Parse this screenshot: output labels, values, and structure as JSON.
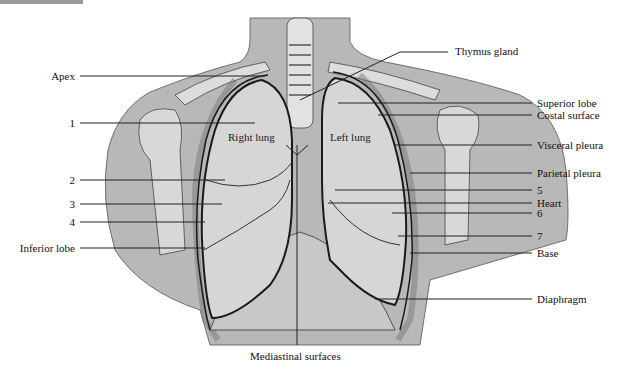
{
  "figure": {
    "colors": {
      "background": "#ffffff",
      "body_silhouette": "#b8b8b8",
      "lung_fill": "#d6d6d6",
      "bone_fill": "#dcdcdc",
      "outline": "#1a1a1a",
      "leader_line": "#222222",
      "corner_tab": "#9a9a9a"
    },
    "inner_labels": {
      "right_lung": "Right lung",
      "left_lung": "Left lung"
    },
    "left_labels": [
      {
        "id": "apex",
        "text": "Apex"
      },
      {
        "id": "n1",
        "text": "1"
      },
      {
        "id": "n2",
        "text": "2"
      },
      {
        "id": "n3",
        "text": "3"
      },
      {
        "id": "n4",
        "text": "4"
      },
      {
        "id": "inferior_lobe",
        "text": "Inferior lobe"
      }
    ],
    "right_labels": [
      {
        "id": "thymus",
        "text": "Thymus gland"
      },
      {
        "id": "superior_lobe",
        "text": "Superior lobe"
      },
      {
        "id": "costal_surface",
        "text": "Costal surface"
      },
      {
        "id": "visceral_pleura",
        "text": "Visceral pleura"
      },
      {
        "id": "parietal_pleura",
        "text": "Parietal pleura"
      },
      {
        "id": "n5",
        "text": "5"
      },
      {
        "id": "heart",
        "text": "Heart"
      },
      {
        "id": "n6",
        "text": "6"
      },
      {
        "id": "n7",
        "text": "7"
      },
      {
        "id": "base",
        "text": "Base"
      },
      {
        "id": "diaphragm",
        "text": "Diaphragm"
      }
    ],
    "bottom_label": {
      "id": "mediastinal",
      "text": "Mediastinal surfaces"
    }
  }
}
